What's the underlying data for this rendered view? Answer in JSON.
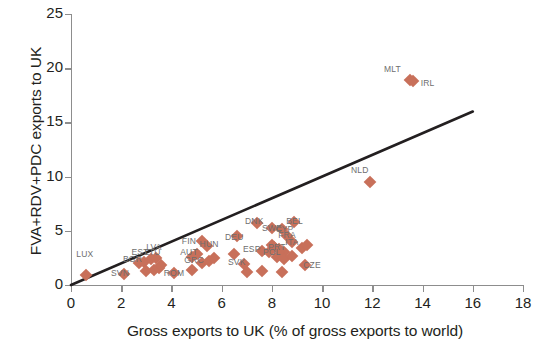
{
  "chart_data": {
    "type": "scatter",
    "title": "",
    "xlabel": "Gross exports to UK (% of gross exports to world)",
    "ylabel": "FVA+RDV+PDC exports to UK",
    "xlim": [
      0,
      18
    ],
    "ylim": [
      0,
      25
    ],
    "xticks": [
      0,
      2,
      4,
      6,
      8,
      10,
      12,
      14,
      16,
      18
    ],
    "yticks": [
      0,
      5,
      10,
      15,
      20,
      25
    ],
    "grid": false,
    "legend": "none",
    "marker_color": "#c8705a",
    "marker_shape": "diamond",
    "trendline": {
      "label": "45-degree reference line",
      "color": "#231f20",
      "x_start": 0,
      "y_start": 0,
      "x_end": 16,
      "y_end": 16
    },
    "points": [
      {
        "label": "LUX",
        "x": 0.6,
        "y": 0.9,
        "lx": 0.55,
        "ly": 2.9
      },
      {
        "label": "SVN",
        "x": 2.1,
        "y": 1.0,
        "lx": 1.95,
        "ly": 1.1
      },
      {
        "label": "BGR",
        "x": 2.7,
        "y": 2.0,
        "lx": 2.45,
        "ly": 2.4
      },
      {
        "label": "EST",
        "x": 2.9,
        "y": 2.1,
        "lx": 2.75,
        "ly": 3.0
      },
      {
        "label": "LTU",
        "x": 3.2,
        "y": 2.4,
        "lx": 3.25,
        "ly": 3.0
      },
      {
        "label": "LVA",
        "x": 3.4,
        "y": 2.5,
        "lx": 3.3,
        "ly": 3.5
      },
      {
        "label": "ROM",
        "x": 4.1,
        "y": 1.1,
        "lx": 4.1,
        "ly": 1.1
      },
      {
        "label": "",
        "x": 3.0,
        "y": 1.3,
        "lx": 0,
        "ly": 0
      },
      {
        "label": "",
        "x": 3.3,
        "y": 1.4,
        "lx": 0,
        "ly": 0
      },
      {
        "label": "",
        "x": 3.5,
        "y": 1.6,
        "lx": 0,
        "ly": 0
      },
      {
        "label": "",
        "x": 3.6,
        "y": 1.8,
        "lx": 0,
        "ly": 0
      },
      {
        "label": "",
        "x": 4.8,
        "y": 1.4,
        "lx": 0,
        "ly": 0
      },
      {
        "label": "AUT",
        "x": 4.8,
        "y": 2.6,
        "lx": 4.7,
        "ly": 3.0
      },
      {
        "label": "GRC",
        "x": 5.0,
        "y": 2.9,
        "lx": 4.9,
        "ly": 2.3
      },
      {
        "label": "HUN",
        "x": 5.4,
        "y": 3.6,
        "lx": 5.5,
        "ly": 3.8
      },
      {
        "label": "FIN",
        "x": 5.2,
        "y": 4.1,
        "lx": 4.7,
        "ly": 4.1
      },
      {
        "label": "",
        "x": 5.2,
        "y": 2.0,
        "lx": 0,
        "ly": 0
      },
      {
        "label": "",
        "x": 5.5,
        "y": 2.2,
        "lx": 0,
        "ly": 0
      },
      {
        "label": "",
        "x": 5.7,
        "y": 2.5,
        "lx": 0,
        "ly": 0
      },
      {
        "label": "DEU",
        "x": 6.6,
        "y": 4.5,
        "lx": 6.5,
        "ly": 4.4
      },
      {
        "label": "",
        "x": 6.5,
        "y": 2.9,
        "lx": 0,
        "ly": 0
      },
      {
        "label": "SVK",
        "x": 6.9,
        "y": 1.9,
        "lx": 6.6,
        "ly": 2.1
      },
      {
        "label": "",
        "x": 7.0,
        "y": 1.2,
        "lx": 0,
        "ly": 0
      },
      {
        "label": "",
        "x": 7.6,
        "y": 1.3,
        "lx": 0,
        "ly": 0
      },
      {
        "label": "ESP",
        "x": 7.6,
        "y": 3.1,
        "lx": 7.2,
        "ly": 3.3
      },
      {
        "label": "POL",
        "x": 7.9,
        "y": 3.0,
        "lx": 8.0,
        "ly": 3.0
      },
      {
        "label": "PRT",
        "x": 8.1,
        "y": 3.5,
        "lx": 8.2,
        "ly": 3.5
      },
      {
        "label": "DNK",
        "x": 7.4,
        "y": 5.7,
        "lx": 7.3,
        "ly": 5.9
      },
      {
        "label": "SWE",
        "x": 8.0,
        "y": 5.3,
        "lx": 8.0,
        "ly": 5.3
      },
      {
        "label": "CYP",
        "x": 8.4,
        "y": 5.2,
        "lx": 8.5,
        "ly": 5.2
      },
      {
        "label": "BEL",
        "x": 8.9,
        "y": 5.8,
        "lx": 8.9,
        "ly": 5.9
      },
      {
        "label": "FRA",
        "x": 8.6,
        "y": 4.5,
        "lx": 8.6,
        "ly": 4.6
      },
      {
        "label": "ITA",
        "x": 8.8,
        "y": 4.0,
        "lx": 8.8,
        "ly": 4.0
      },
      {
        "label": "",
        "x": 8.0,
        "y": 3.7,
        "lx": 0,
        "ly": 0
      },
      {
        "label": "",
        "x": 8.3,
        "y": 3.3,
        "lx": 0,
        "ly": 0
      },
      {
        "label": "",
        "x": 8.5,
        "y": 3.0,
        "lx": 0,
        "ly": 0
      },
      {
        "label": "",
        "x": 8.2,
        "y": 2.6,
        "lx": 0,
        "ly": 0
      },
      {
        "label": "",
        "x": 8.5,
        "y": 2.4,
        "lx": 0,
        "ly": 0
      },
      {
        "label": "",
        "x": 8.8,
        "y": 2.7,
        "lx": 0,
        "ly": 0
      },
      {
        "label": "",
        "x": 9.2,
        "y": 3.4,
        "lx": 0,
        "ly": 0
      },
      {
        "label": "",
        "x": 9.4,
        "y": 3.7,
        "lx": 0,
        "ly": 0
      },
      {
        "label": "CZE",
        "x": 9.3,
        "y": 1.8,
        "lx": 9.6,
        "ly": 1.8
      },
      {
        "label": "",
        "x": 8.4,
        "y": 1.2,
        "lx": 0,
        "ly": 0
      },
      {
        "label": "NLD",
        "x": 11.9,
        "y": 9.5,
        "lx": 11.5,
        "ly": 10.6
      },
      {
        "label": "MLT",
        "x": 13.5,
        "y": 18.9,
        "lx": 12.8,
        "ly": 19.9
      },
      {
        "label": "IRL",
        "x": 13.6,
        "y": 18.8,
        "lx": 14.2,
        "ly": 18.6
      }
    ]
  }
}
